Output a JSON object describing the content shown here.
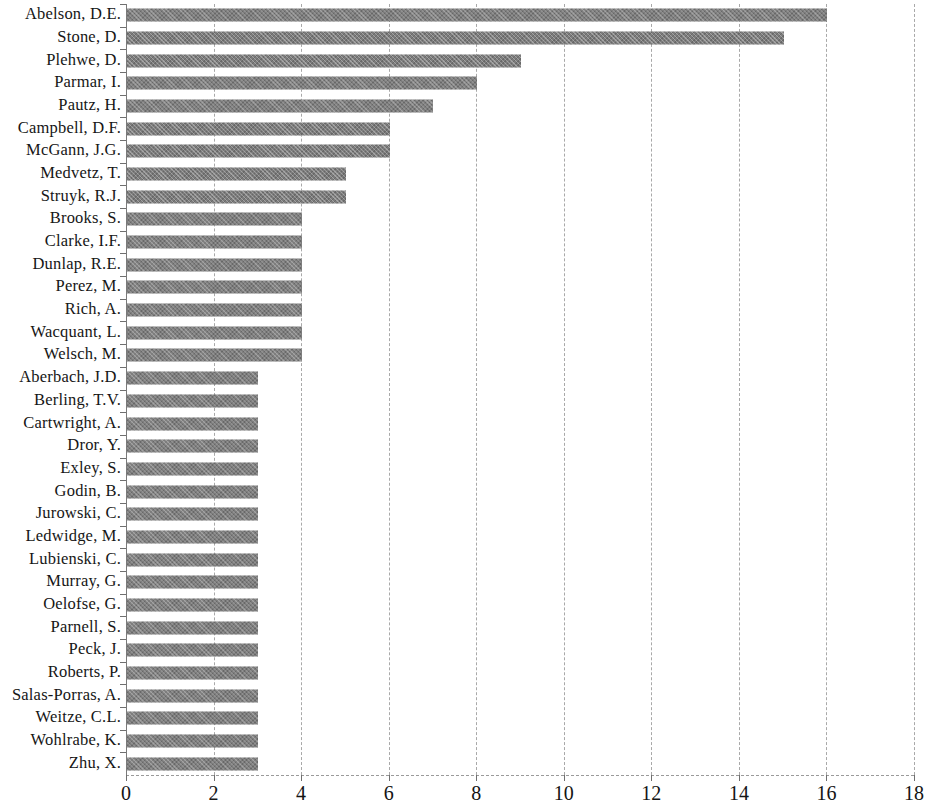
{
  "chart_data": {
    "type": "bar",
    "orientation": "horizontal",
    "title": "",
    "subtitle": "",
    "xlabel": "",
    "ylabel": "",
    "xlim": [
      0,
      18
    ],
    "ylim": null,
    "grid": true,
    "legend": null,
    "xticks": [
      0,
      2,
      4,
      6,
      8,
      10,
      12,
      14,
      16,
      18
    ],
    "xtick_labels": [
      "0",
      "2",
      "4",
      "6",
      "8",
      "10",
      "12",
      "14",
      "16",
      "18"
    ],
    "categories": [
      "Abelson, D.E.",
      "Stone, D.",
      "Plehwe, D.",
      "Parmar, I.",
      "Pautz, H.",
      "Campbell, D.F.",
      "McGann, J.G.",
      "Medvetz, T.",
      "Struyk, R.J.",
      "Brooks, S.",
      "Clarke, I.F.",
      "Dunlap, R.E.",
      "Perez, M.",
      "Rich, A.",
      "Wacquant, L.",
      "Welsch, M.",
      "Aberbach, J.D.",
      "Berling, T.V.",
      "Cartwright, A.",
      "Dror, Y.",
      "Exley, S.",
      "Godin, B.",
      "Jurowski, C.",
      "Ledwidge, M.",
      "Lubienski, C.",
      "Murray, G.",
      "Oelofse, G.",
      "Parnell, S.",
      "Peck, J.",
      "Roberts, P.",
      "Salas-Porras, A.",
      "Weitze, C.L.",
      "Wohlrabe, K.",
      "Zhu, X."
    ],
    "values": [
      16,
      15,
      9,
      8,
      7,
      6,
      6,
      5,
      5,
      4,
      4,
      4,
      4,
      4,
      4,
      4,
      3,
      3,
      3,
      3,
      3,
      3,
      3,
      3,
      3,
      3,
      3,
      3,
      3,
      3,
      3,
      3,
      3,
      3
    ],
    "bar_color": "#7c7c7c",
    "grid_color": "#a9a9a9"
  }
}
